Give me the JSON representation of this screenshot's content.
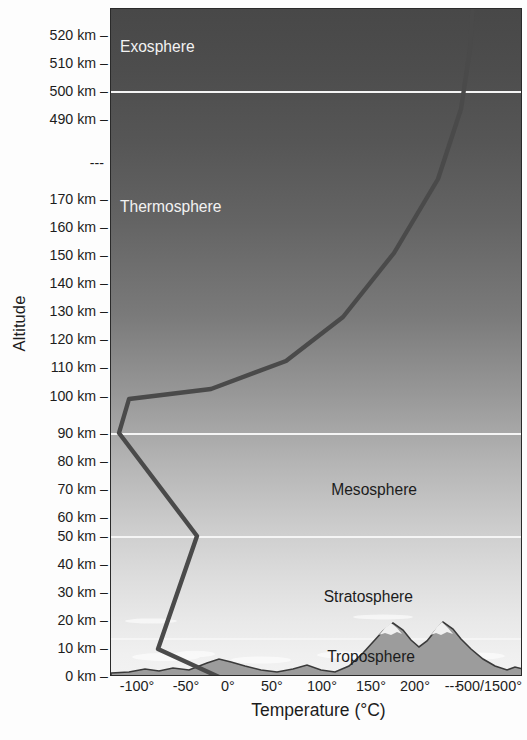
{
  "chart_data": {
    "type": "line",
    "title": "",
    "xlabel": "Temperature (°C)",
    "ylabel": "Altitude",
    "grid": false,
    "legend_position": "none",
    "x_tick_labels": [
      "-100°",
      "-50°",
      "0°",
      "50°",
      "100°",
      "150°",
      "200°",
      "---",
      "500/1500°"
    ],
    "y_tick_labels": [
      "520 km",
      "510 km",
      "500 km",
      "490 km",
      "---",
      "170 km",
      "160 km",
      "150 km",
      "140 km",
      "130 km",
      "120 km",
      "110 km",
      "100 km",
      "90 km",
      "80 km",
      "70 km",
      "60 km",
      "50 km",
      "40 km",
      "30 km",
      "20 km",
      "10 km",
      "0 km"
    ],
    "series": [
      {
        "name": "Temperature profile",
        "color": "#4a4a4a",
        "points": [
          {
            "altitude_km": 0,
            "temperature_c": 15
          },
          {
            "altitude_km": 11,
            "temperature_c": -55
          },
          {
            "altitude_km": 50,
            "temperature_c": -3
          },
          {
            "altitude_km": 90,
            "temperature_c": -90
          },
          {
            "altitude_km": 100,
            "temperature_c": -78
          },
          {
            "altitude_km": 110,
            "temperature_c": 210
          },
          {
            "altitude_km": 130,
            "temperature_c": 420
          },
          {
            "altitude_km": 170,
            "temperature_c": 560
          },
          {
            "altitude_km": 500,
            "temperature_c": 700
          },
          {
            "altitude_km": 520,
            "temperature_c": 710
          }
        ]
      }
    ],
    "layers": [
      {
        "name": "Exosphere",
        "top_km": 520,
        "bottom_km": 500,
        "label_color": "light"
      },
      {
        "name": "Thermosphere",
        "top_km": 500,
        "bottom_km": 90,
        "label_color": "light"
      },
      {
        "name": "Mesosphere",
        "top_km": 90,
        "bottom_km": 50,
        "label_color": "dark"
      },
      {
        "name": "Stratosphere",
        "top_km": 50,
        "bottom_km": 12,
        "label_color": "dark"
      },
      {
        "name": "Troposphere",
        "top_km": 12,
        "bottom_km": 0,
        "label_color": "dark"
      }
    ],
    "boundary_lines_km": [
      500,
      90,
      50,
      12
    ]
  },
  "axes": {
    "y_title": "Altitude",
    "x_title": "Temperature (°C)",
    "tick_dash": "–",
    "y_ticks": [
      {
        "label": "520 km",
        "y": 35
      },
      {
        "label": "510 km",
        "y": 63
      },
      {
        "label": "500 km",
        "y": 91
      },
      {
        "label": "490 km",
        "y": 119
      },
      {
        "label": "---",
        "y": 163
      },
      {
        "label": "170 km",
        "y": 199
      },
      {
        "label": "160 km",
        "y": 227
      },
      {
        "label": "150 km",
        "y": 255
      },
      {
        "label": "140 km",
        "y": 283
      },
      {
        "label": "130 km",
        "y": 311
      },
      {
        "label": "120 km",
        "y": 339
      },
      {
        "label": "110 km",
        "y": 367
      },
      {
        "label": "100 km",
        "y": 396
      },
      {
        "label": "90 km",
        "y": 433
      },
      {
        "label": "80 km",
        "y": 461
      },
      {
        "label": "70 km",
        "y": 489
      },
      {
        "label": "60 km",
        "y": 517
      },
      {
        "label": "50 km",
        "y": 536
      },
      {
        "label": "40 km",
        "y": 564
      },
      {
        "label": "30 km",
        "y": 592
      },
      {
        "label": "20 km",
        "y": 620
      },
      {
        "label": "10 km",
        "y": 648
      },
      {
        "label": "0 km",
        "y": 676
      }
    ],
    "x_ticks": [
      {
        "label": "-100°",
        "x": 137
      },
      {
        "label": "-50°",
        "x": 186
      },
      {
        "label": "0°",
        "x": 228
      },
      {
        "label": "50°",
        "x": 272
      },
      {
        "label": "100°",
        "x": 322
      },
      {
        "label": "150°",
        "x": 371
      },
      {
        "label": "200°",
        "x": 415
      },
      {
        "label": "---",
        "x": 452
      },
      {
        "label": "500/1500°",
        "x": 489
      }
    ]
  },
  "layer_labels": [
    {
      "name": "Exosphere",
      "left": 119,
      "top": 38,
      "tone": "light",
      "align": "left"
    },
    {
      "name": "Thermosphere",
      "left": 119,
      "top": 198,
      "tone": "light",
      "align": "left"
    },
    {
      "name": "Mesosphere",
      "left": 410,
      "top": 481,
      "tone": "dark",
      "align": "right"
    },
    {
      "name": "Stratosphere",
      "left": 406,
      "top": 588,
      "tone": "dark",
      "align": "right"
    },
    {
      "name": "Troposphere",
      "left": 408,
      "top": 648,
      "tone": "dark",
      "align": "right"
    }
  ],
  "colors": {
    "curve": "#4a4a4a",
    "boundary_line": "#f5f5f5",
    "plot_border": "#2a2a2a",
    "text": "#1c1c1c",
    "label_light": "#f2f2f2",
    "ground": "#4f4f4f"
  }
}
